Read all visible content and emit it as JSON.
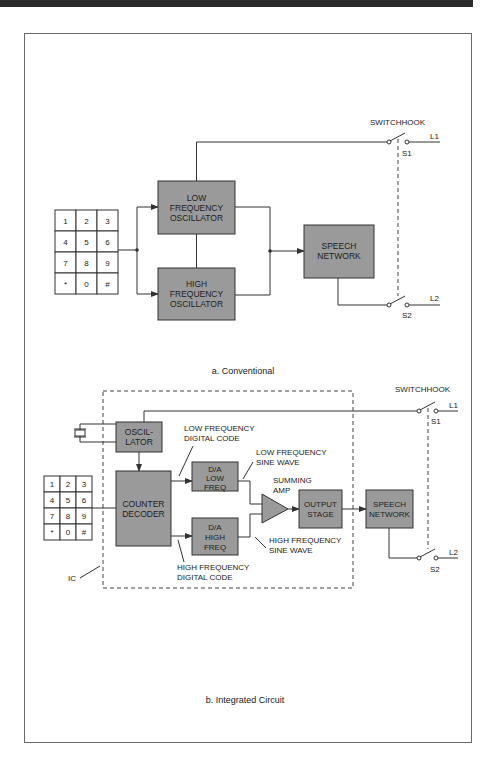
{
  "figure": {
    "part_a": {
      "caption": "a. Conventional",
      "switchhook_label": "SWITCHHOOK",
      "switch_labels": {
        "s1": "S1",
        "s2": "S2",
        "l1": "L1",
        "l2": "L2"
      },
      "keypad": [
        "1",
        "2",
        "3",
        "4",
        "5",
        "6",
        "7",
        "8",
        "9",
        "*",
        "0",
        "#"
      ],
      "blocks": {
        "low_osc": [
          "LOW",
          "FREQUENCY",
          "OSCILLATOR"
        ],
        "high_osc": [
          "HIGH",
          "FREQUENCY",
          "OSCILLATOR"
        ],
        "speech": [
          "SPEECH",
          "NETWORK"
        ]
      }
    },
    "part_b": {
      "caption": "b. Integrated Circuit",
      "switchhook_label": "SWITCHHOOK",
      "switch_labels": {
        "s1": "S1",
        "s2": "S2",
        "l1": "L1",
        "l2": "L2"
      },
      "ic_label": "IC",
      "keypad": [
        "1",
        "2",
        "3",
        "4",
        "5",
        "6",
        "7",
        "8",
        "9",
        "*",
        "0",
        "#"
      ],
      "blocks": {
        "oscillator": [
          "OSCIL-",
          "LATOR"
        ],
        "counter": [
          "COUNTER",
          "DECODER"
        ],
        "da_low": [
          "D/A",
          "LOW",
          "FREQ"
        ],
        "da_high": [
          "D/A",
          "HIGH",
          "FREQ"
        ],
        "output": [
          "OUTPUT",
          "STAGE"
        ],
        "speech": [
          "SPEECH",
          "NETWORK"
        ]
      },
      "annotations": {
        "low_digital": [
          "LOW FREQUENCY",
          "DIGITAL CODE"
        ],
        "high_digital": [
          "HIGH FREQUENCY",
          "DIGITAL CODE"
        ],
        "low_sine": [
          "LOW FREQUENCY",
          "SINE WAVE"
        ],
        "high_sine": [
          "HIGH FREQUENCY",
          "SINE WAVE"
        ],
        "summing": [
          "SUMMING",
          "AMP"
        ]
      }
    }
  }
}
